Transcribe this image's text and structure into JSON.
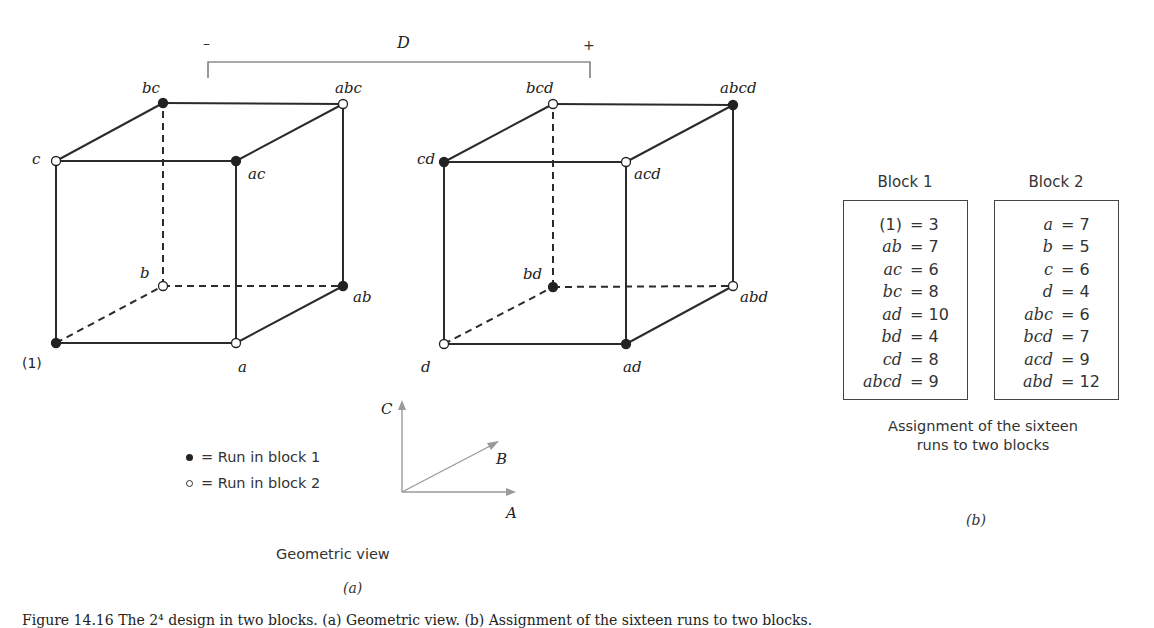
{
  "figure": {
    "factor_D": {
      "label": "D",
      "minus_label": "–",
      "plus_label": "+"
    },
    "colors": {
      "edge": "#2b2b2b",
      "block1_dot": "#222222",
      "block2_dot": "#ffffff",
      "axis_arrows": "#9a9a9a"
    },
    "cubes": [
      {
        "name": "D-minus",
        "vertices": [
          {
            "label": "(1)",
            "block": 1,
            "x": 56,
            "y": 343,
            "lx": 22,
            "ly": 368,
            "italic": false
          },
          {
            "label": "a",
            "block": 2,
            "x": 236,
            "y": 343,
            "lx": 238,
            "ly": 372,
            "italic": true
          },
          {
            "label": "b",
            "block": 2,
            "x": 163,
            "y": 286,
            "lx": 140,
            "ly": 278,
            "italic": true
          },
          {
            "label": "ab",
            "block": 1,
            "x": 343,
            "y": 286,
            "lx": 353,
            "ly": 302,
            "italic": true
          },
          {
            "label": "c",
            "block": 2,
            "x": 56,
            "y": 161,
            "lx": 32,
            "ly": 164,
            "italic": true
          },
          {
            "label": "ac",
            "block": 1,
            "x": 236,
            "y": 161,
            "lx": 248,
            "ly": 179,
            "italic": true
          },
          {
            "label": "bc",
            "block": 1,
            "x": 163,
            "y": 103,
            "lx": 142,
            "ly": 93,
            "italic": true
          },
          {
            "label": "abc",
            "block": 2,
            "x": 343,
            "y": 104,
            "lx": 335,
            "ly": 93,
            "italic": true
          }
        ]
      },
      {
        "name": "D-plus",
        "vertices": [
          {
            "label": "d",
            "block": 2,
            "x": 444,
            "y": 344,
            "lx": 421,
            "ly": 372,
            "italic": true
          },
          {
            "label": "ad",
            "block": 1,
            "x": 626,
            "y": 344,
            "lx": 623,
            "ly": 372,
            "italic": true
          },
          {
            "label": "bd",
            "block": 1,
            "x": 553,
            "y": 287,
            "lx": 523,
            "ly": 279,
            "italic": true
          },
          {
            "label": "abd",
            "block": 2,
            "x": 733,
            "y": 286,
            "lx": 740,
            "ly": 302,
            "italic": true
          },
          {
            "label": "cd",
            "block": 1,
            "x": 444,
            "y": 162,
            "lx": 417,
            "ly": 164,
            "italic": true
          },
          {
            "label": "acd",
            "block": 2,
            "x": 626,
            "y": 162,
            "lx": 634,
            "ly": 179,
            "italic": true
          },
          {
            "label": "bcd",
            "block": 2,
            "x": 553,
            "y": 104,
            "lx": 526,
            "ly": 93,
            "italic": true
          },
          {
            "label": "abcd",
            "block": 1,
            "x": 733,
            "y": 105,
            "lx": 720,
            "ly": 93,
            "italic": true
          }
        ]
      }
    ],
    "axes": {
      "A_label": "A",
      "B_label": "B",
      "C_label": "C"
    },
    "legend": [
      {
        "symbol": "filled",
        "text": "= Run in block 1"
      },
      {
        "symbol": "open",
        "text": "= Run in block 2"
      }
    ],
    "left_caption": "Geometric view",
    "left_sublabel": "(a)",
    "blocks": [
      {
        "title": "Block 1",
        "runs": [
          {
            "run": "(1)",
            "value": "= 3"
          },
          {
            "run": "ab",
            "value": "= 7"
          },
          {
            "run": "ac",
            "value": "= 6"
          },
          {
            "run": "bc",
            "value": "= 8"
          },
          {
            "run": "ad",
            "value": "= 10"
          },
          {
            "run": "bd",
            "value": "= 4"
          },
          {
            "run": "cd",
            "value": "= 8"
          },
          {
            "run": "abcd",
            "value": "= 9"
          }
        ]
      },
      {
        "title": "Block 2",
        "runs": [
          {
            "run": "a",
            "value": "= 7"
          },
          {
            "run": "b",
            "value": "= 5"
          },
          {
            "run": "c",
            "value": "= 6"
          },
          {
            "run": "d",
            "value": "= 4"
          },
          {
            "run": "abc",
            "value": "= 6"
          },
          {
            "run": "bcd",
            "value": "= 7"
          },
          {
            "run": "acd",
            "value": "= 9"
          },
          {
            "run": "abd",
            "value": "= 12"
          }
        ]
      }
    ],
    "right_caption_line1": "Assignment of the sixteen",
    "right_caption_line2": "runs to two blocks",
    "right_sublabel": "(b)",
    "figure_caption": "Figure 14.16   The 2⁴ design in two blocks. (a) Geometric view. (b) Assignment of the sixteen runs to two blocks."
  }
}
